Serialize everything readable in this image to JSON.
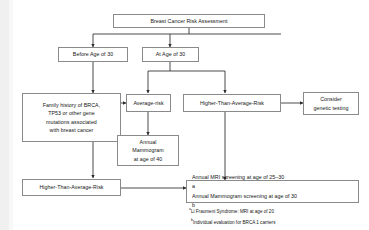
{
  "diagram": {
    "nodes": {
      "root": "Breast Cancer Risk Assessment",
      "before_30": "Before Age of 30",
      "at_30": "At Age of 30",
      "family_history": "Family history of BRCA, TP53 or other gene mutations associated with breast cancer",
      "family_history_lines": [
        "Family history of BRCA,",
        "TP53 or other gene",
        "mutations associated",
        "with breast cancer"
      ],
      "average_risk": "Average-risk",
      "higher_risk_top": "Higher-Than-Average-Risk",
      "consider_genetic_testing": "Consider genetic testing",
      "consider_genetic_testing_lines": [
        "Consider",
        "genetic testing"
      ],
      "annual_mammogram_40": "Annual Mammogram at age of 40",
      "annual_mammogram_40_lines": [
        "Annual",
        "Mammogram",
        "at age of 40"
      ],
      "higher_risk_bottom": "Higher-Than-Average-Risk",
      "screening_line_1": "Annual MRI screening at age of 25–30",
      "screening_line_1_sup": "a",
      "screening_line_2": "Annual Mammogram screening at age of 30",
      "screening_line_2_sup": "b"
    },
    "footnotes": [
      {
        "marker": "a",
        "text": "Li Fraumeni Syndrome: MRI at age of 20"
      },
      {
        "marker": "b",
        "text": "Individual evaluation for BRCA 1 carriers"
      }
    ],
    "colors": {
      "box_border": "#8a8a8a",
      "box_fill": "#ffffff",
      "connector": "#2b2b2b",
      "text": "#141414",
      "page_background": "#ffffff"
    }
  }
}
